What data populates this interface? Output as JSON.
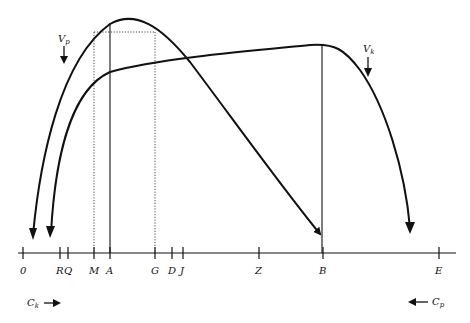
{
  "diagram": {
    "colors": {
      "ink": "#111111",
      "background": "#ffffff"
    },
    "axis_ticks": [
      {
        "label": "0",
        "x": 23
      },
      {
        "label": "R",
        "x": 60
      },
      {
        "label": "Q",
        "x": 68
      },
      {
        "label": "M",
        "x": 94
      },
      {
        "label": "A",
        "x": 110
      },
      {
        "label": "G",
        "x": 155
      },
      {
        "label": "D",
        "x": 172
      },
      {
        "label": "J",
        "x": 183
      },
      {
        "label": "Z",
        "x": 259
      },
      {
        "label": "B",
        "x": 323
      },
      {
        "label": "E",
        "x": 439
      }
    ],
    "curves": [
      {
        "name": "Vp",
        "label_main": "V",
        "label_sub": "p"
      },
      {
        "name": "Vk",
        "label_main": "V",
        "label_sub": "k"
      }
    ],
    "direction_labels": {
      "ck": {
        "main": "C",
        "sub": "k"
      },
      "cp": {
        "main": "C",
        "sub": "p"
      }
    }
  }
}
